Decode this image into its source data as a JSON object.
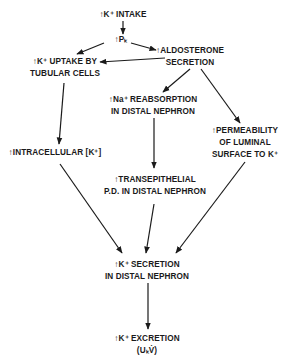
{
  "diagram": {
    "title": "",
    "nodes": {
      "k_intake": {
        "lines": [
          "↑K⁺ INTAKE"
        ]
      },
      "pk": {
        "lines": [
          "↑Pₖ"
        ]
      },
      "aldosterone": {
        "lines": [
          "↑ALDOSTERONE",
          "SECRETION"
        ]
      },
      "k_uptake": {
        "lines": [
          "↑K⁺ UPTAKE BY",
          "TUBULAR CELLS"
        ]
      },
      "na_reabsorption": {
        "lines": [
          "↑Na⁺ REABSORPTION",
          "IN DISTAL NEPHRON"
        ]
      },
      "intracellular_k": {
        "lines": [
          "↑INTRACELLULAR [K⁺]"
        ]
      },
      "permeability": {
        "lines": [
          "↑PERMEABILITY",
          "OF LUMINAL",
          "SURFACE TO K⁺"
        ]
      },
      "transepithelial": {
        "lines": [
          "↑TRANSEPITHELIAL",
          "P.D. IN DISTAL NEPHRON"
        ]
      },
      "k_secretion": {
        "lines": [
          "↑K⁺ SECRETION",
          "IN DISTAL NEPHRON"
        ]
      },
      "k_excretion": {
        "lines": [
          "↑K⁺ EXCRETION",
          "(UₖV̇)"
        ]
      }
    },
    "edges": [
      {
        "from": "k_intake",
        "to": "pk"
      },
      {
        "from": "pk",
        "to": "k_uptake"
      },
      {
        "from": "pk",
        "to": "aldosterone"
      },
      {
        "from": "aldosterone",
        "to": "k_uptake"
      },
      {
        "from": "aldosterone",
        "to": "na_reabsorption"
      },
      {
        "from": "aldosterone",
        "to": "permeability"
      },
      {
        "from": "k_uptake",
        "to": "intracellular_k"
      },
      {
        "from": "na_reabsorption",
        "to": "transepithelial"
      },
      {
        "from": "intracellular_k",
        "to": "k_secretion"
      },
      {
        "from": "transepithelial",
        "to": "k_secretion"
      },
      {
        "from": "permeability",
        "to": "k_secretion"
      },
      {
        "from": "k_secretion",
        "to": "k_excretion"
      }
    ],
    "colors": {
      "ink": "#1a1a1a",
      "background": "#ffffff"
    }
  }
}
